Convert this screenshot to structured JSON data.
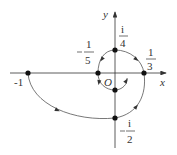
{
  "diagram": {
    "type": "complex-plane-path",
    "axes": {
      "x_label": "x",
      "y_label": "y",
      "origin_label": "O"
    },
    "points": [
      {
        "id": "minus-one",
        "label": "-1",
        "num": "",
        "den": "",
        "sign": "-"
      },
      {
        "id": "minus-one-fifth",
        "label": "-1/5",
        "num": "1",
        "den": "5",
        "sign": "-"
      },
      {
        "id": "one-third",
        "label": "1/3",
        "num": "1",
        "den": "3",
        "sign": ""
      },
      {
        "id": "i-quarter",
        "label": "i/4",
        "num": "i",
        "den": "4",
        "sign": ""
      },
      {
        "id": "minus-i-half",
        "label": "-i/2",
        "num": "i",
        "den": "2",
        "sign": "-"
      },
      {
        "id": "inner-point",
        "label": "",
        "num": "",
        "den": "",
        "sign": ""
      }
    ],
    "minus_one_text": "-1",
    "colors": {
      "axis": "#333333",
      "curve": "#555555",
      "point": "#111111"
    }
  }
}
